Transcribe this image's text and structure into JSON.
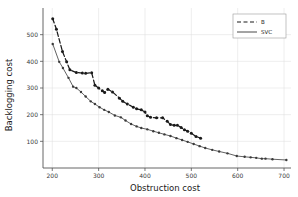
{
  "chart_data": {
    "type": "line",
    "title": "",
    "xlabel": "Obstruction cost",
    "ylabel": "Backlogging cost",
    "xlim": [
      180,
      715
    ],
    "ylim": [
      0,
      600
    ],
    "xticks": [
      200,
      300,
      400,
      500,
      600,
      700
    ],
    "yticks": [
      100,
      200,
      300,
      400,
      500
    ],
    "grid": true,
    "legend_position": "top-right",
    "markers": "filled-circle",
    "series": [
      {
        "name": "B",
        "style": "dashed",
        "color": "#1a1a1a",
        "points": [
          [
            201,
            560
          ],
          [
            209,
            520
          ],
          [
            222,
            437
          ],
          [
            231,
            398
          ],
          [
            238,
            368
          ],
          [
            252,
            358
          ],
          [
            265,
            356
          ],
          [
            272,
            355
          ],
          [
            285,
            357
          ],
          [
            292,
            310
          ],
          [
            300,
            300
          ],
          [
            308,
            290
          ],
          [
            313,
            283
          ],
          [
            320,
            295
          ],
          [
            330,
            285
          ],
          [
            345,
            262
          ],
          [
            352,
            250
          ],
          [
            362,
            240
          ],
          [
            375,
            228
          ],
          [
            382,
            222
          ],
          [
            392,
            218
          ],
          [
            400,
            210
          ],
          [
            405,
            196
          ],
          [
            412,
            190
          ],
          [
            425,
            188
          ],
          [
            438,
            188
          ],
          [
            448,
            175
          ],
          [
            455,
            163
          ],
          [
            463,
            160
          ],
          [
            470,
            160
          ],
          [
            478,
            152
          ],
          [
            485,
            143
          ],
          [
            492,
            138
          ],
          [
            500,
            130
          ],
          [
            510,
            118
          ],
          [
            520,
            112
          ]
        ]
      },
      {
        "name": "SVC",
        "style": "solid",
        "color": "#3a3a3a",
        "points": [
          [
            201,
            465
          ],
          [
            215,
            398
          ],
          [
            223,
            375
          ],
          [
            235,
            338
          ],
          [
            245,
            305
          ],
          [
            252,
            300
          ],
          [
            262,
            285
          ],
          [
            272,
            268
          ],
          [
            283,
            250
          ],
          [
            292,
            240
          ],
          [
            302,
            228
          ],
          [
            312,
            218
          ],
          [
            322,
            210
          ],
          [
            335,
            197
          ],
          [
            348,
            190
          ],
          [
            358,
            178
          ],
          [
            370,
            165
          ],
          [
            382,
            156
          ],
          [
            392,
            150
          ],
          [
            405,
            145
          ],
          [
            418,
            138
          ],
          [
            430,
            132
          ],
          [
            442,
            126
          ],
          [
            455,
            120
          ],
          [
            468,
            112
          ],
          [
            480,
            105
          ],
          [
            492,
            98
          ],
          [
            505,
            90
          ],
          [
            518,
            82
          ],
          [
            530,
            75
          ],
          [
            545,
            68
          ],
          [
            560,
            62
          ],
          [
            578,
            55
          ],
          [
            598,
            45
          ],
          [
            615,
            42
          ],
          [
            628,
            40
          ],
          [
            640,
            38
          ],
          [
            652,
            35
          ],
          [
            660,
            35
          ],
          [
            675,
            33
          ],
          [
            705,
            30
          ]
        ]
      }
    ]
  },
  "legend": {
    "entries": [
      {
        "label": "B",
        "style": "dashed"
      },
      {
        "label": "SVC",
        "style": "solid"
      }
    ]
  }
}
